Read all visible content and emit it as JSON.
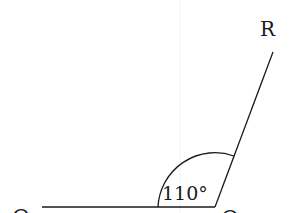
{
  "diagram": {
    "type": "angle",
    "angle_label": "110°",
    "points": {
      "left": "O",
      "vertex": "Q",
      "ray_end": "R"
    },
    "colors": {
      "line": "#1a1a1a",
      "background": "#ffffff"
    }
  }
}
